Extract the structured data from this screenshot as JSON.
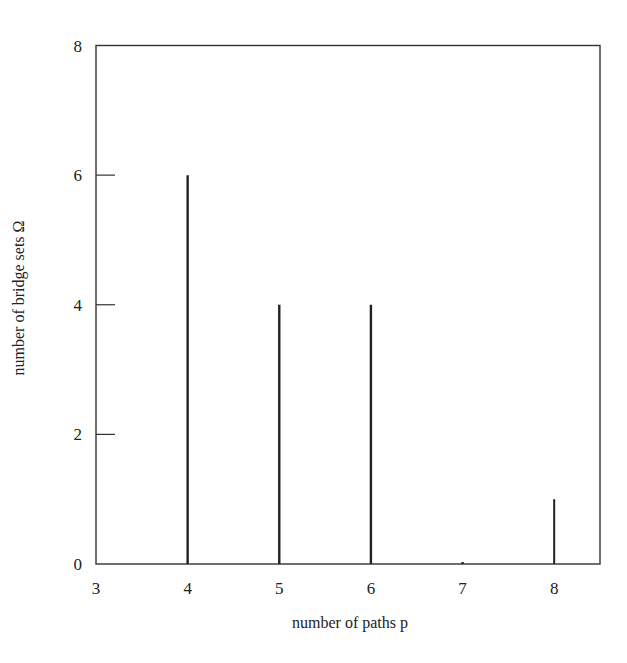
{
  "chart_data": {
    "type": "bar",
    "style": "stem",
    "title": "",
    "xlabel": "number of paths p",
    "ylabel": "number of bridge sets Ω",
    "x": [
      4,
      5,
      6,
      7,
      8
    ],
    "values": [
      6,
      4,
      4,
      0,
      1
    ],
    "xlim": [
      3,
      8.5
    ],
    "ylim": [
      0,
      8
    ],
    "xticks": [
      3,
      4,
      5,
      6,
      7,
      8
    ],
    "yticks": [
      0,
      2,
      4,
      6,
      8
    ],
    "grid": false,
    "legend": null,
    "colors": {
      "bar": "#222222",
      "axis": "#333333"
    }
  }
}
